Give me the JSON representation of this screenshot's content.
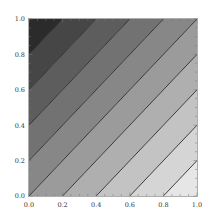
{
  "chart_data": {
    "type": "contour",
    "title": "",
    "xlabel": "",
    "ylabel": "",
    "xlim": [
      0.0,
      1.0
    ],
    "ylim": [
      0.0,
      1.0
    ],
    "function_description": "z = x - y (linear gradient, contours are diagonal lines)",
    "contour_levels": [
      -0.8,
      -0.6,
      -0.4,
      -0.2,
      0.0,
      0.2,
      0.4,
      0.6,
      0.8
    ],
    "band_colors": [
      "#2b2b2b",
      "#464646",
      "#5d5d5d",
      "#727272",
      "#878787",
      "#9b9b9b",
      "#afafaf",
      "#c3c3c3",
      "#d5d5d5",
      "#e6e6e6"
    ],
    "line_color": "#2a2a2a",
    "x_ticks": [
      {
        "value": 0.0,
        "label": "0.0"
      },
      {
        "value": 0.2,
        "label": "0.2"
      },
      {
        "value": 0.4,
        "label": "0.4"
      },
      {
        "value": 0.6,
        "label": "0.6"
      },
      {
        "value": 0.8,
        "label": "0.8"
      },
      {
        "value": 1.0,
        "label": "1.0"
      }
    ],
    "y_ticks": [
      {
        "value": 0.0,
        "label": "0.0"
      },
      {
        "value": 0.2,
        "label": "0.2"
      },
      {
        "value": 0.4,
        "label": "0.4"
      },
      {
        "value": 0.6,
        "label": "0.6"
      },
      {
        "value": 0.8,
        "label": "0.8"
      },
      {
        "value": 1.0,
        "label": "1.0"
      }
    ],
    "grid": false,
    "legend": null
  },
  "layout": {
    "plot_left": 29,
    "plot_top": 19,
    "plot_right": 197,
    "plot_bottom": 196,
    "frame_color": "#9a9a9a"
  }
}
